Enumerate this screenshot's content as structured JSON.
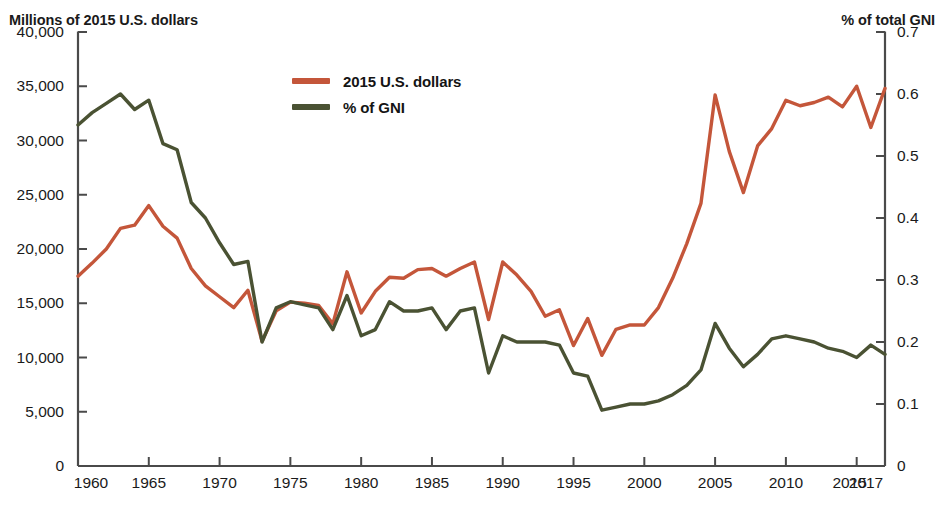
{
  "chart_data": {
    "type": "line",
    "title": "",
    "subtitle": "",
    "xlabel": "",
    "ylabel": "Millions of 2015 U.S. dollars",
    "y2label": "% of total GNI",
    "grid": false,
    "legend_position": "top-center",
    "xlim": [
      1960,
      2017
    ],
    "ylim": [
      0,
      40000
    ],
    "y2lim": [
      0,
      0.7
    ],
    "x_ticks": [
      1960,
      1965,
      1970,
      1975,
      1980,
      1985,
      1990,
      1995,
      2000,
      2005,
      2010,
      2015,
      2017
    ],
    "x_tick_labels": [
      "1960",
      "1965",
      "1970",
      "1975",
      "1980",
      "1985",
      "1990",
      "1995",
      "2000",
      "2005",
      "2010",
      "2015",
      "2017"
    ],
    "y_ticks": [
      0,
      5000,
      10000,
      15000,
      20000,
      25000,
      30000,
      35000,
      40000
    ],
    "y_tick_labels": [
      "0",
      "5,000",
      "10,000",
      "15,000",
      "20,000",
      "25,000",
      "30,000",
      "35,000",
      "40,000"
    ],
    "y2_ticks": [
      0,
      0.1,
      0.2,
      0.3,
      0.4,
      0.5,
      0.6,
      0.7
    ],
    "y2_tick_labels": [
      "0",
      "0.1",
      "0.2",
      "0.3",
      "0.4",
      "0.5",
      "0.6",
      "0.7"
    ],
    "x": [
      1960,
      1961,
      1962,
      1963,
      1964,
      1965,
      1966,
      1967,
      1968,
      1969,
      1970,
      1971,
      1972,
      1973,
      1974,
      1975,
      1976,
      1977,
      1978,
      1979,
      1980,
      1981,
      1982,
      1983,
      1984,
      1985,
      1986,
      1987,
      1988,
      1989,
      1990,
      1991,
      1992,
      1993,
      1994,
      1995,
      1996,
      1997,
      1998,
      1999,
      2000,
      2001,
      2002,
      2003,
      2004,
      2005,
      2006,
      2007,
      2008,
      2009,
      2010,
      2011,
      2012,
      2013,
      2014,
      2015,
      2016,
      2017
    ],
    "series": [
      {
        "name": "2015 U.S. dollars",
        "axis": "left",
        "color": "#C4563A",
        "values": [
          17500,
          18700,
          20000,
          21900,
          22200,
          24000,
          22100,
          21000,
          18200,
          16600,
          15600,
          14600,
          16200,
          11500,
          14300,
          15100,
          15000,
          14800,
          13100,
          17900,
          14100,
          16100,
          17400,
          17300,
          18100,
          18200,
          17500,
          18200,
          18800,
          13500,
          18800,
          17600,
          16100,
          13800,
          14400,
          11100,
          13600,
          10200,
          12600,
          13000,
          13000,
          14600,
          17300,
          20500,
          24200,
          34200,
          29000,
          25200,
          29500,
          31100,
          33700,
          33200,
          33500,
          34000,
          33100,
          35000,
          31200,
          34800
        ]
      },
      {
        "name": "% of GNI",
        "axis": "right",
        "color": "#4A5233",
        "values": [
          0.55,
          0.57,
          0.585,
          0.6,
          0.575,
          0.59,
          0.52,
          0.51,
          0.425,
          0.4,
          0.36,
          0.325,
          0.33,
          0.2,
          0.255,
          0.265,
          0.26,
          0.255,
          0.22,
          0.275,
          0.21,
          0.22,
          0.265,
          0.25,
          0.25,
          0.255,
          0.22,
          0.25,
          0.255,
          0.15,
          0.21,
          0.2,
          0.2,
          0.2,
          0.195,
          0.15,
          0.145,
          0.09,
          0.095,
          0.1,
          0.1,
          0.105,
          0.115,
          0.13,
          0.155,
          0.23,
          0.19,
          0.16,
          0.18,
          0.205,
          0.21,
          0.205,
          0.2,
          0.19,
          0.185,
          0.175,
          0.195,
          0.18
        ]
      }
    ],
    "legend": [
      {
        "label": "2015 U.S. dollars",
        "color": "#C4563A"
      },
      {
        "label": "% of GNI",
        "color": "#4A5233"
      }
    ]
  },
  "geometry": {
    "plot_left": 78,
    "plot_right": 885,
    "plot_top": 32,
    "plot_bottom": 466
  },
  "colors": {
    "dollars": "#C4563A",
    "gni": "#4A5233",
    "axis": "#4a4a4a",
    "text": "#1a1a1a"
  }
}
